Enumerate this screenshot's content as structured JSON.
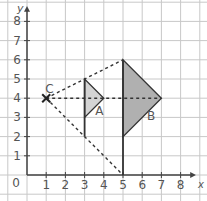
{
  "diagram": {
    "type": "coordinate-grid-enlargement",
    "axes": {
      "x_label": "x",
      "y_label": "y",
      "origin_label": "0",
      "x_ticks": [
        "1",
        "2",
        "3",
        "4",
        "5",
        "6",
        "7",
        "8"
      ],
      "y_ticks": [
        "1",
        "2",
        "3",
        "4",
        "5",
        "6",
        "7",
        "8"
      ],
      "x_range": [
        0,
        8
      ],
      "y_range": [
        0,
        8
      ]
    },
    "center": {
      "label": "C",
      "x": 1,
      "y": 4
    },
    "shapes": [
      {
        "label": "A",
        "vertices": [
          [
            3,
            5
          ],
          [
            3,
            3
          ],
          [
            4,
            4
          ]
        ],
        "fill": "#d4d4d4"
      },
      {
        "label": "B",
        "vertices": [
          [
            5,
            6
          ],
          [
            5,
            2
          ],
          [
            7,
            4
          ]
        ],
        "fill": "#b0b0b0"
      }
    ],
    "dashed_lines": [
      {
        "from": [
          1,
          4
        ],
        "to": [
          5,
          6
        ]
      },
      {
        "from": [
          1,
          4
        ],
        "to": [
          7,
          4
        ]
      },
      {
        "from": [
          1,
          4
        ],
        "to": [
          5,
          0
        ]
      }
    ],
    "solid_lines": [
      {
        "from": [
          3,
          2
        ],
        "to": [
          3,
          5
        ]
      },
      {
        "from": [
          5,
          0
        ],
        "to": [
          5,
          6
        ]
      }
    ],
    "colors": {
      "grid": "#c8c8c8",
      "axis": "#444444",
      "ink": "#333333"
    }
  }
}
